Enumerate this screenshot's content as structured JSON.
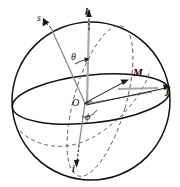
{
  "figure": {
    "kind": "spherical-coordinate-diagram",
    "title": "",
    "stroke_color": "#121212",
    "dashed_color": "#3a3a3a",
    "axis_gray": "#9a9a9a",
    "background": "#ffffff",
    "width": 180,
    "height": 187
  },
  "labels": {
    "k_axis": "k",
    "s_line": "s",
    "theta_angle": "θ",
    "point_m": "M",
    "j_axis": "j",
    "origin": "O",
    "phi_angle": "ϕ",
    "i_axis": "i"
  },
  "geometry": {
    "sphere_center": {
      "x": 91,
      "y": 101
    },
    "sphere_radius": 79,
    "equator_rx": 79,
    "equator_ry": 24,
    "equator_cy": 99,
    "origin_point": {
      "x": 84,
      "y": 104
    },
    "point_m": {
      "x": 128,
      "y": 79
    },
    "k_axis_tip": {
      "x": 88,
      "y": 12
    },
    "j_axis_tip": {
      "x": 170,
      "y": 88
    },
    "i_axis_tip": {
      "x": 78,
      "y": 160
    },
    "s_line_tip": {
      "x": 45,
      "y": 22
    }
  }
}
